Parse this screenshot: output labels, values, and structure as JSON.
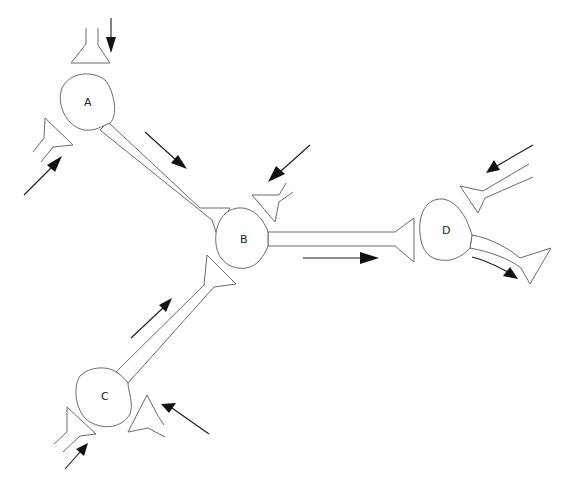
{
  "diagram": {
    "type": "neural-circuit",
    "neurons": [
      {
        "id": "A",
        "label": "A"
      },
      {
        "id": "B",
        "label": "B"
      },
      {
        "id": "C",
        "label": "C"
      },
      {
        "id": "D",
        "label": "D"
      }
    ],
    "connections": [
      {
        "from": "A",
        "to": "B"
      },
      {
        "from": "C",
        "to": "B"
      },
      {
        "from": "B",
        "to": "D"
      }
    ],
    "colors": {
      "outline": "#6a6a6a",
      "arrow": "#111111",
      "background": "#ffffff"
    }
  }
}
